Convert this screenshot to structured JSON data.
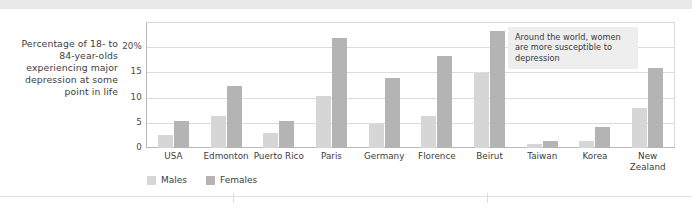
{
  "y_axis_caption": "Percentage of 18- to 84-year-olds experiencing major depression at some point in life",
  "annotation": {
    "text": "Around the world, women are more susceptible to depression"
  },
  "legend": {
    "males_label": "Males",
    "females_label": "Females"
  },
  "colors": {
    "males": "#d6d6d6",
    "females": "#b4b4b4",
    "gridline": "#dcdcdc",
    "axis": "#b9b9b9",
    "annotation_bg": "#eeeeee",
    "top_band": "#e8e9ea"
  },
  "chart_data": {
    "type": "bar",
    "title": "",
    "subtitle": "",
    "xlabel": "",
    "ylabel": "Percentage of 18- to 84-year-olds experiencing major depression at some point in life",
    "ylim": [
      0,
      25
    ],
    "yticks": [
      "0",
      "5",
      "10",
      "15",
      "20%"
    ],
    "ytick_values": [
      0,
      5,
      10,
      15,
      20
    ],
    "grid": true,
    "legend_position": "bottom-left",
    "categories": [
      "USA",
      "Edmonton",
      "Puerto Rico",
      "Paris",
      "Germany",
      "Florence",
      "Beirut",
      "Taiwan",
      "Korea",
      "New Zealand"
    ],
    "series": [
      {
        "name": "Males",
        "color": "#d6d6d6",
        "values": [
          2.7,
          6.5,
          3.0,
          10.5,
          4.8,
          6.5,
          15.0,
          0.8,
          1.5,
          8.0
        ]
      },
      {
        "name": "Females",
        "color": "#b4b4b4",
        "values": [
          5.5,
          12.5,
          5.5,
          22.0,
          14.0,
          18.5,
          23.5,
          1.5,
          4.3,
          16.0
        ]
      }
    ],
    "annotations": [
      {
        "text": "Around the world, women are more susceptible to depression",
        "target": "Beirut"
      }
    ]
  }
}
